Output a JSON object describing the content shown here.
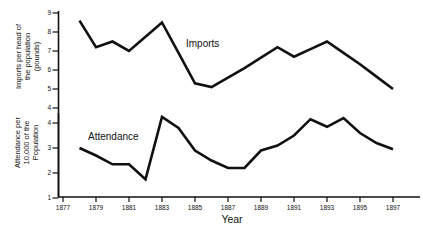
{
  "figure": {
    "background": "#ffffff",
    "line_color": "#111111",
    "imports_series_label": "Imports",
    "attendance_series_label": "Attendance",
    "x_axis_title": "Year",
    "imports_axis_title_lines": [
      "Imports per head of",
      "the population",
      "(pounds)"
    ],
    "attendance_axis_title_lines": [
      "Attendance per",
      "10,000 of the",
      "Population"
    ]
  },
  "chart_data": [
    {
      "type": "line",
      "name": "Imports",
      "ylabel": "Imports per head of the population (pounds)",
      "xlabel": "Year",
      "x": [
        1878,
        1879,
        1880,
        1881,
        1882,
        1883,
        1884,
        1885,
        1886,
        1887,
        1888,
        1889,
        1890,
        1891,
        1892,
        1893,
        1894,
        1895,
        1896,
        1897
      ],
      "values": [
        8.6,
        7.2,
        7.5,
        7.0,
        7.75,
        8.5,
        6.9,
        5.3,
        5.1,
        5.6,
        6.1,
        6.65,
        7.2,
        6.7,
        7.1,
        7.5,
        6.9,
        6.3,
        5.65,
        5.0
      ],
      "ylim": [
        4,
        9
      ],
      "yticks": [
        9,
        8,
        7,
        6,
        5,
        4
      ],
      "xlim": [
        1877,
        1898
      ],
      "xticks": [
        1877,
        1879,
        1881,
        1883,
        1885,
        1887,
        1889,
        1891,
        1893,
        1895,
        1897
      ],
      "grid": false,
      "legend": "inline-text-label"
    },
    {
      "type": "line",
      "name": "Attendance",
      "ylabel": "Attendance per 10,000 of the Population",
      "xlabel": "Year",
      "x": [
        1878,
        1879,
        1880,
        1881,
        1882,
        1883,
        1884,
        1885,
        1886,
        1887,
        1888,
        1889,
        1890,
        1891,
        1892,
        1893,
        1894,
        1895,
        1896,
        1897
      ],
      "values": [
        3.0,
        2.7,
        2.35,
        2.35,
        1.75,
        4.25,
        3.8,
        2.9,
        2.5,
        2.2,
        2.2,
        2.9,
        3.1,
        3.5,
        4.15,
        3.85,
        4.2,
        3.6,
        3.2,
        2.95
      ],
      "ylim": [
        1,
        4
      ],
      "yticks": [
        4,
        3,
        2,
        1
      ],
      "xlim": [
        1877,
        1898
      ],
      "xticks": [
        1877,
        1879,
        1881,
        1883,
        1885,
        1887,
        1889,
        1891,
        1893,
        1895,
        1897
      ],
      "grid": false,
      "legend": "inline-text-label"
    }
  ]
}
